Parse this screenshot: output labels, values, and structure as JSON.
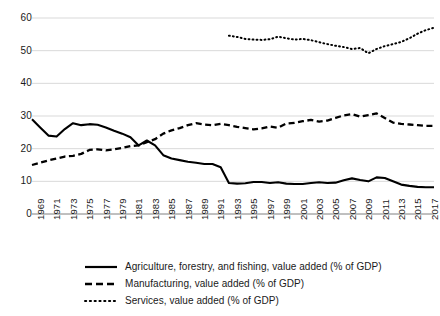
{
  "chart_data": {
    "type": "line",
    "title": "",
    "subtitle": "",
    "xlabel": "",
    "ylabel": "",
    "xlim": [
      1969,
      2018
    ],
    "ylim": [
      0,
      60
    ],
    "y_ticks": [
      0,
      10,
      20,
      30,
      40,
      50,
      60
    ],
    "x_ticks": [
      1969,
      1971,
      1973,
      1975,
      1977,
      1979,
      1981,
      1983,
      1985,
      1987,
      1989,
      1991,
      1993,
      1995,
      1997,
      1999,
      2001,
      2003,
      2005,
      2007,
      2009,
      2011,
      2013,
      2015,
      2017
    ],
    "grid": "horizontal",
    "legend_position": "bottom",
    "x": [
      1969,
      1970,
      1971,
      1972,
      1973,
      1974,
      1975,
      1976,
      1977,
      1978,
      1979,
      1980,
      1981,
      1982,
      1983,
      1984,
      1985,
      1986,
      1987,
      1988,
      1989,
      1990,
      1991,
      1992,
      1993,
      1994,
      1995,
      1996,
      1997,
      1998,
      1999,
      2000,
      2001,
      2002,
      2003,
      2004,
      2005,
      2006,
      2007,
      2008,
      2009,
      2010,
      2011,
      2012,
      2013,
      2014,
      2015,
      2016,
      2017,
      2018
    ],
    "series": [
      {
        "name": "Agriculture, forestry, and fishing, value added (% of GDP)",
        "style": "solid",
        "color": "#000000",
        "values": [
          29.0,
          26.5,
          24.0,
          23.7,
          26.0,
          27.8,
          27.2,
          27.5,
          27.3,
          26.5,
          25.5,
          24.6,
          23.5,
          21.0,
          22.5,
          21.0,
          18.0,
          17.0,
          16.5,
          16.0,
          15.7,
          15.3,
          15.3,
          14.3,
          9.5,
          9.3,
          9.4,
          9.8,
          9.8,
          9.5,
          9.7,
          9.3,
          9.2,
          9.2,
          9.5,
          9.7,
          9.5,
          9.6,
          10.3,
          10.9,
          10.4,
          10.0,
          11.2,
          11.0,
          10.0,
          9.0,
          8.6,
          8.3,
          8.2,
          8.2
        ]
      },
      {
        "name": "Manufacturing, value added (% of GDP)",
        "style": "dashed",
        "color": "#000000",
        "values": [
          15.0,
          15.7,
          16.4,
          17.0,
          17.6,
          17.8,
          18.4,
          19.6,
          19.8,
          19.5,
          19.8,
          20.2,
          20.8,
          21.0,
          22.0,
          22.9,
          24.6,
          25.6,
          26.3,
          27.2,
          27.8,
          27.4,
          27.2,
          27.6,
          27.2,
          26.7,
          26.3,
          25.9,
          26.2,
          26.8,
          26.4,
          27.7,
          27.9,
          28.4,
          28.8,
          28.3,
          28.6,
          29.4,
          30.2,
          30.6,
          29.8,
          30.3,
          30.8,
          29.4,
          28.0,
          27.6,
          27.4,
          27.2,
          27.0,
          27.0
        ]
      },
      {
        "name": "Services, value added (% of GDP)",
        "style": "dotted",
        "color": "#000000",
        "values": [
          null,
          null,
          null,
          null,
          null,
          null,
          null,
          null,
          null,
          null,
          null,
          null,
          null,
          null,
          null,
          null,
          null,
          null,
          null,
          null,
          null,
          null,
          null,
          null,
          54.6,
          54.2,
          53.6,
          53.4,
          53.3,
          53.5,
          54.3,
          53.8,
          53.4,
          53.6,
          53.2,
          52.6,
          52.0,
          51.5,
          51.1,
          50.5,
          50.8,
          49.2,
          50.5,
          51.4,
          52.0,
          52.7,
          53.8,
          55.2,
          56.3,
          57.0
        ]
      }
    ]
  },
  "legend": {
    "items": [
      {
        "label": "Agriculture, forestry, and fishing, value added (% of GDP)",
        "style": "solid"
      },
      {
        "label": "Manufacturing, value added (% of GDP)",
        "style": "dashed"
      },
      {
        "label": "Services, value added (% of GDP)",
        "style": "dotted"
      }
    ]
  },
  "axis_colors": {
    "grid": "#d9d9d9",
    "baseline": "#808080",
    "text": "#1a1a1a"
  }
}
